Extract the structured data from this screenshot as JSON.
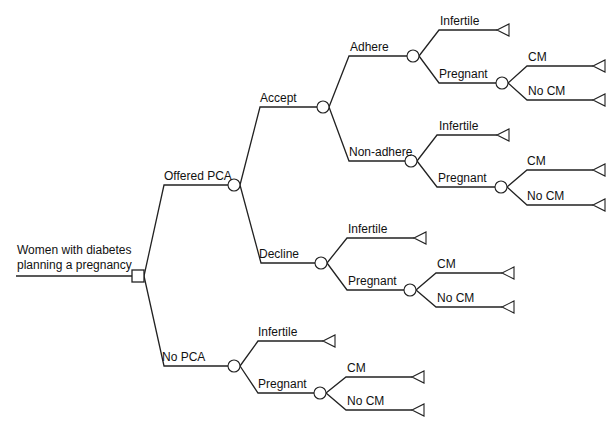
{
  "diagram": {
    "type": "decision-tree",
    "colors": {
      "line": "#222222",
      "background": "#ffffff",
      "text": "#111111"
    },
    "root": {
      "label_line1": "Women with diabetes",
      "label_line2": "planning a pregnancy",
      "node_type": "decision"
    },
    "branches": {
      "offered_pca": "Offered PCA",
      "no_pca": "No PCA",
      "accept": "Accept",
      "decline": "Decline",
      "adhere": "Adhere",
      "non_adhere": "Non-adhere",
      "infertile": "Infertile",
      "pregnant": "Pregnant",
      "cm": "CM",
      "no_cm": "No CM"
    },
    "tree": {
      "label": "Women with diabetes planning a pregnancy",
      "node": "decision",
      "children": [
        {
          "label": "Offered PCA",
          "node": "chance",
          "children": [
            {
              "label": "Accept",
              "node": "chance",
              "children": [
                {
                  "label": "Adhere",
                  "node": "chance",
                  "children": [
                    {
                      "label": "Infertile",
                      "node": "terminal"
                    },
                    {
                      "label": "Pregnant",
                      "node": "chance",
                      "children": [
                        {
                          "label": "CM",
                          "node": "terminal"
                        },
                        {
                          "label": "No CM",
                          "node": "terminal"
                        }
                      ]
                    }
                  ]
                },
                {
                  "label": "Non-adhere",
                  "node": "chance",
                  "children": [
                    {
                      "label": "Infertile",
                      "node": "terminal"
                    },
                    {
                      "label": "Pregnant",
                      "node": "chance",
                      "children": [
                        {
                          "label": "CM",
                          "node": "terminal"
                        },
                        {
                          "label": "No CM",
                          "node": "terminal"
                        }
                      ]
                    }
                  ]
                }
              ]
            },
            {
              "label": "Decline",
              "node": "chance",
              "children": [
                {
                  "label": "Infertile",
                  "node": "terminal"
                },
                {
                  "label": "Pregnant",
                  "node": "chance",
                  "children": [
                    {
                      "label": "CM",
                      "node": "terminal"
                    },
                    {
                      "label": "No CM",
                      "node": "terminal"
                    }
                  ]
                }
              ]
            }
          ]
        },
        {
          "label": "No PCA",
          "node": "chance",
          "children": [
            {
              "label": "Infertile",
              "node": "terminal"
            },
            {
              "label": "Pregnant",
              "node": "chance",
              "children": [
                {
                  "label": "CM",
                  "node": "terminal"
                },
                {
                  "label": "No CM",
                  "node": "terminal"
                }
              ]
            }
          ]
        }
      ]
    }
  }
}
